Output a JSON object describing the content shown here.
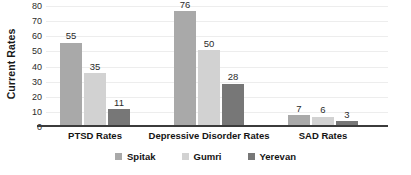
{
  "chart_data": {
    "type": "bar",
    "title": "",
    "xlabel": "",
    "ylabel": "Current Rates",
    "ylim": [
      0,
      80
    ],
    "yticks": [
      0,
      10,
      20,
      30,
      40,
      50,
      60,
      70,
      80
    ],
    "ytick_labels": [
      "0",
      "10",
      "20",
      "30",
      "40",
      "50",
      "60",
      "70",
      "80"
    ],
    "grid": true,
    "legend_position": "bottom",
    "categories": [
      "PTSD Rates",
      "Depressive Disorder Rates",
      "SAD Rates"
    ],
    "series": [
      {
        "name": "Spitak",
        "color": "#a9a9a9",
        "values": [
          55,
          76,
          7
        ]
      },
      {
        "name": "Gumri",
        "color": "#d2d2d2",
        "values": [
          35,
          50,
          6
        ]
      },
      {
        "name": "Yerevan",
        "color": "#777777",
        "values": [
          11,
          28,
          3
        ]
      }
    ],
    "data_labels": [
      {
        "category": "PTSD Rates",
        "series": "Spitak",
        "value": 55
      },
      {
        "category": "PTSD Rates",
        "series": "Gumri",
        "value": 35
      },
      {
        "category": "PTSD Rates",
        "series": "Yerevan",
        "value": 11
      },
      {
        "category": "Depressive Disorder Rates",
        "series": "Spitak",
        "value": 76
      },
      {
        "category": "Depressive Disorder Rates",
        "series": "Gumri",
        "value": 50
      },
      {
        "category": "Depressive Disorder Rates",
        "series": "Yerevan",
        "value": 28
      },
      {
        "category": "SAD Rates",
        "series": "Spitak",
        "value": 7
      },
      {
        "category": "SAD Rates",
        "series": "Gumri",
        "value": 6
      },
      {
        "category": "SAD Rates",
        "series": "Yerevan",
        "value": 3
      }
    ]
  },
  "style": {
    "background": "#ffffff",
    "axis_color": "#3b3b3b",
    "gridline_color": "#ededed",
    "text_color": "#1a1a1a"
  }
}
